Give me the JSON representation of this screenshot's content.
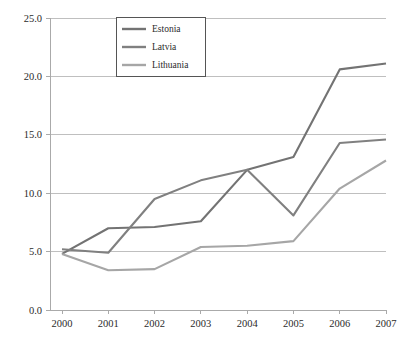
{
  "chart_data": {
    "type": "line",
    "title": "",
    "subtitle": "",
    "xlabel": "",
    "ylabel": "",
    "categories": [
      "2000",
      "2001",
      "2002",
      "2003",
      "2004",
      "2005",
      "2006",
      "2007"
    ],
    "x": [
      2000,
      2001,
      2002,
      2003,
      2004,
      2005,
      2006,
      2007
    ],
    "series": [
      {
        "name": "Estonia",
        "color": "#737373",
        "values": [
          4.8,
          7.0,
          7.1,
          7.6,
          12.0,
          13.1,
          20.6,
          21.1
        ]
      },
      {
        "name": "Latvia",
        "color": "#808080",
        "values": [
          5.2,
          4.9,
          9.5,
          11.1,
          12.0,
          8.1,
          14.3,
          14.6
        ]
      },
      {
        "name": "Lithuania",
        "color": "#a6a6a6",
        "values": [
          4.8,
          3.4,
          3.5,
          5.4,
          5.5,
          5.9,
          10.4,
          12.8
        ]
      }
    ],
    "ylim": [
      0.0,
      25.0
    ],
    "y_ticks": [
      0.0,
      5.0,
      10.0,
      15.0,
      20.0,
      25.0
    ],
    "y_tick_labels": [
      "0.0",
      "5.0",
      "10.0",
      "15.0",
      "20.0",
      "25.0"
    ],
    "x_tick_labels": [
      "2000",
      "2001",
      "2002",
      "2003",
      "2004",
      "2005",
      "2006",
      "2007"
    ],
    "grid": true,
    "grid_axis": "y",
    "legend_position": "top-center-inside",
    "legend_entries": [
      "Estonia",
      "Latvia",
      "Lithuania"
    ],
    "colors": {
      "gridline": "#bfbfbf",
      "axis": "#aaaaaa",
      "text": "#2b2b2b",
      "background": "#ffffff",
      "legend_border": "#555555"
    }
  }
}
